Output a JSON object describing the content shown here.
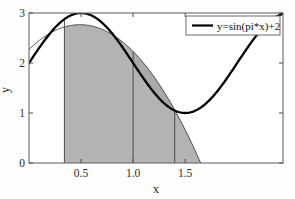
{
  "figure": {
    "background": "#ffffff",
    "axes_color": "#555555",
    "curve_color": "#000000",
    "fill_color": "#b3b3b3",
    "fill_opacity": 0.85
  },
  "legend": {
    "entries": [
      {
        "label": "y=sin(pi*x)+2",
        "color": "#000000",
        "style": "line"
      }
    ],
    "position": "top-right",
    "border_color": "#555555"
  },
  "chart_data": {
    "type": "line",
    "title": "",
    "subtitle": "",
    "xlabel": "x",
    "ylabel": "y",
    "xlim": [
      0,
      2.44
    ],
    "ylim": [
      0,
      3
    ],
    "xticks": [
      0.5,
      1.0,
      1.5
    ],
    "xticklabels": [
      "0.5",
      "1.0",
      "1.5"
    ],
    "yticks": [
      0,
      1,
      2,
      3
    ],
    "yticklabels": [
      "0",
      "1",
      "2",
      "3"
    ],
    "grid": false,
    "legend_position": "top-right",
    "series": [
      {
        "name": "y=sin(pi*x)+2",
        "style": "thick-line",
        "color": "#000000",
        "linewidth": 2.2,
        "formula": "sin(pi*x)+2",
        "x": [
          0,
          0.1,
          0.2,
          0.3,
          0.34,
          0.4,
          0.5,
          0.6,
          0.7,
          0.8,
          0.9,
          1.0,
          1.1,
          1.2,
          1.3,
          1.4,
          1.5,
          1.6,
          1.7,
          1.8,
          1.9,
          2.0,
          2.1,
          2.2,
          2.3,
          2.44
        ],
        "values": [
          2.0,
          2.309,
          2.588,
          2.809,
          2.871,
          2.951,
          3.0,
          2.951,
          2.809,
          2.588,
          2.309,
          2.0,
          1.691,
          1.412,
          1.191,
          1.049,
          1.0,
          1.049,
          1.191,
          1.412,
          1.691,
          2.0,
          2.309,
          2.588,
          2.809,
          2.988
        ]
      },
      {
        "name": "quadratic-interpolant",
        "style": "thin-line",
        "color": "#444444",
        "linewidth": 0.9,
        "note": "parabola through the three nodes",
        "x": [
          0,
          0.2,
          0.34,
          0.5,
          0.7,
          0.87,
          1.0,
          1.2,
          1.4,
          1.5,
          1.62
        ],
        "values": [
          2.24,
          2.57,
          2.72,
          2.78,
          2.68,
          2.46,
          2.23,
          1.71,
          1.06,
          0.68,
          0.08
        ]
      }
    ],
    "shaded_regions": [
      {
        "name": "left-panel",
        "x_start": 0.34,
        "x_end": 1.0,
        "y_base": 0,
        "y_top_curve": "quadratic-interpolant",
        "color": "#b3b3b3"
      },
      {
        "name": "right-panel",
        "x_start": 1.0,
        "x_end": 1.65,
        "y_base": 0,
        "y_top_curve": "quadratic-interpolant",
        "color": "#b3b3b3"
      }
    ],
    "node_markers": [
      {
        "x": 0.34,
        "y": 2.72
      },
      {
        "x": 1.0,
        "y": 2.23
      },
      {
        "x": 1.4,
        "y": 1.06
      }
    ],
    "vertical_dividers": [
      {
        "x": 0.34
      },
      {
        "x": 1.0
      },
      {
        "x": 1.4
      }
    ]
  }
}
